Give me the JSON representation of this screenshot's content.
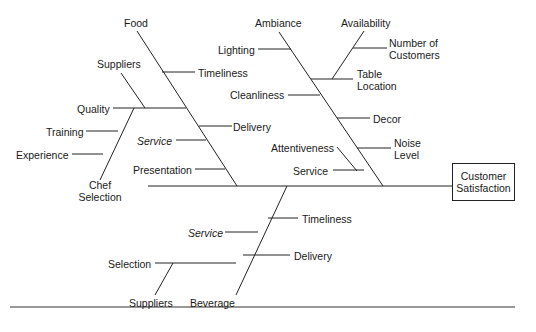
{
  "diagram": {
    "type": "fishbone",
    "effect": {
      "line1": "Customer",
      "line2": "Satisfaction"
    },
    "categories": {
      "food": {
        "label": "Food",
        "causes": {
          "timeliness": "Timeliness",
          "quality": "Quality",
          "suppliers": "Suppliers",
          "training": "Training",
          "experience": "Experience",
          "chef_selection_1": "Chef",
          "chef_selection_2": "Selection",
          "delivery": "Delivery",
          "service": "Service",
          "presentation": "Presentation"
        }
      },
      "ambiance": {
        "label": "Ambiance",
        "causes": {
          "lighting": "Lighting",
          "availability": "Availability",
          "num_customers_1": "Number of",
          "num_customers_2": "Customers",
          "table_location_1": "Table",
          "table_location_2": "Location",
          "cleanliness": "Cleanliness",
          "decor": "Decor",
          "attentiveness": "Attentiveness",
          "noise_level_1": "Noise",
          "noise_level_2": "Level",
          "service": "Service"
        }
      },
      "beverage": {
        "label": "Beverage",
        "causes": {
          "timeliness": "Timeliness",
          "service": "Service",
          "delivery": "Delivery",
          "selection": "Selection",
          "suppliers": "Suppliers"
        }
      }
    },
    "colors": {
      "line": "#222222",
      "text": "#1a1a1a",
      "background": "#ffffff"
    }
  }
}
